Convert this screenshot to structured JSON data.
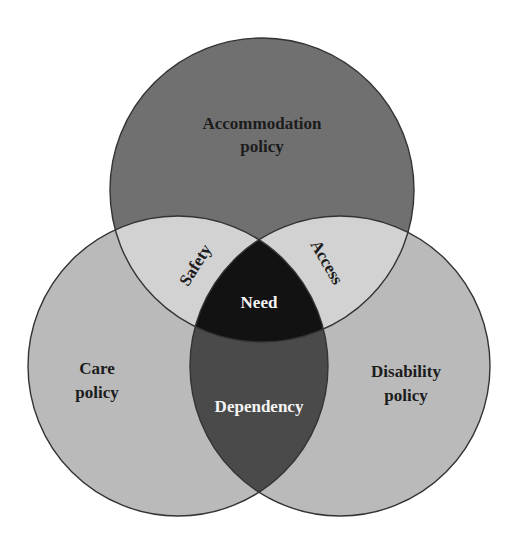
{
  "diagram": {
    "type": "venn-3",
    "sets": [
      {
        "id": "accommodation",
        "label_line1": "Accommodation",
        "label_line2": "policy",
        "color": "#707070"
      },
      {
        "id": "care",
        "label_line1": "Care",
        "label_line2": "policy",
        "color": "#bababa"
      },
      {
        "id": "disability",
        "label_line1": "Disability",
        "label_line2": "policy",
        "color": "#bababa"
      }
    ],
    "intersections": {
      "accommodation_care": {
        "label": "Safety",
        "color": "#d2d2d2"
      },
      "accommodation_disability": {
        "label": "Access",
        "color": "#d2d2d2"
      },
      "care_disability": {
        "label": "Dependency",
        "color": "#4a4a4a"
      },
      "all_three": {
        "label": "Need",
        "color": "#121212"
      }
    },
    "outline_color": "#333333"
  }
}
